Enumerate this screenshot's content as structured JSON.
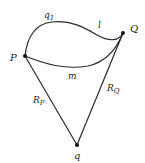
{
  "diagram": {
    "type": "path-diagram",
    "colors": {
      "stroke": "#2a2a2a",
      "point": "#111111",
      "text": "#222222",
      "background": "#ffffff"
    },
    "points": [
      {
        "id": "P",
        "label": "P",
        "x": 25,
        "y": 56
      },
      {
        "id": "Q",
        "label": "Q",
        "x": 123,
        "y": 33
      },
      {
        "id": "q",
        "label": "q",
        "x": 77,
        "y": 145
      }
    ],
    "edges": [
      {
        "id": "upper-curve",
        "from": "P",
        "to": "Q",
        "labels": [
          "q1",
          "l"
        ]
      },
      {
        "id": "m-curve",
        "from": "P",
        "to": "Q",
        "label": "m"
      },
      {
        "id": "RP",
        "from": "P",
        "to": "q",
        "label": "R_P"
      },
      {
        "id": "RQ",
        "from": "Q",
        "to": "q",
        "label": "R_Q"
      }
    ],
    "labels": {
      "P": "P",
      "Q": "Q",
      "q": "q",
      "q1_main": "q",
      "q1_sub": "1",
      "l": "l",
      "m": "m",
      "RP_main": "R",
      "RP_sub": "P",
      "RQ_main": "R",
      "RQ_sub": "Q"
    }
  }
}
